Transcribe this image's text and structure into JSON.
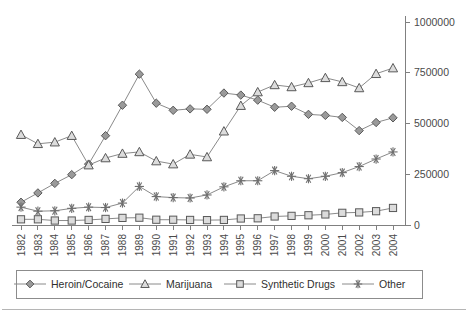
{
  "chart_data": {
    "type": "line",
    "title": "",
    "xlabel": "",
    "ylabel": "",
    "categories": [
      "1982",
      "1983",
      "1984",
      "1985",
      "1986",
      "1987",
      "1988",
      "1989",
      "1990",
      "1991",
      "1992",
      "1993",
      "1994",
      "1995",
      "1996",
      "1997",
      "1998",
      "1999",
      "2000",
      "2001",
      "2002",
      "2003",
      "2004"
    ],
    "ylim": [
      0,
      1000000
    ],
    "yticks": [
      0,
      250000,
      500000,
      750000,
      1000000
    ],
    "ytick_labels": [
      "0",
      "250000",
      "500000",
      "750000",
      "1000000"
    ],
    "yaxis_position": "right",
    "grid": false,
    "legend_position": "bottom",
    "series": [
      {
        "name": "Heroin/Cocaine",
        "marker": "diamond",
        "values": [
          112000,
          158000,
          205000,
          248000,
          300000,
          440000,
          590000,
          743000,
          600000,
          565000,
          572000,
          570000,
          650000,
          640000,
          615000,
          580000,
          585000,
          545000,
          540000,
          530000,
          465000,
          505000,
          528000
        ]
      },
      {
        "name": "Marijuana",
        "marker": "triangle",
        "values": [
          445000,
          400000,
          408000,
          440000,
          295000,
          330000,
          352000,
          360000,
          315000,
          300000,
          348000,
          335000,
          462000,
          588000,
          655000,
          690000,
          680000,
          700000,
          725000,
          705000,
          675000,
          745000,
          773000
        ]
      },
      {
        "name": "Synthetic Drugs",
        "marker": "square",
        "values": [
          28000,
          28000,
          22000,
          22000,
          25000,
          30000,
          35000,
          36000,
          26000,
          26000,
          25000,
          24000,
          25000,
          32000,
          33000,
          42000,
          45000,
          48000,
          52000,
          60000,
          62000,
          68000,
          84000
        ]
      },
      {
        "name": "Other",
        "marker": "asterisk",
        "values": [
          88000,
          68000,
          70000,
          82000,
          88000,
          86000,
          108000,
          190000,
          140000,
          135000,
          133000,
          148000,
          188000,
          218000,
          218000,
          268000,
          240000,
          228000,
          240000,
          258000,
          288000,
          325000,
          360000
        ]
      }
    ]
  },
  "legend": {
    "items": [
      {
        "label": "Heroin/Cocaine",
        "marker": "diamond"
      },
      {
        "label": "Marijuana",
        "marker": "triangle"
      },
      {
        "label": "Synthetic Drugs",
        "marker": "square"
      },
      {
        "label": "Other",
        "marker": "asterisk"
      }
    ]
  },
  "colors": {
    "line": "#8a8a8a",
    "marker_stroke": "#595959",
    "marker_fill": "#9a9a9a",
    "marker_open": "#dcdcdc",
    "axis": "#808080",
    "text": "#4a4a4a",
    "background": "#ffffff"
  }
}
